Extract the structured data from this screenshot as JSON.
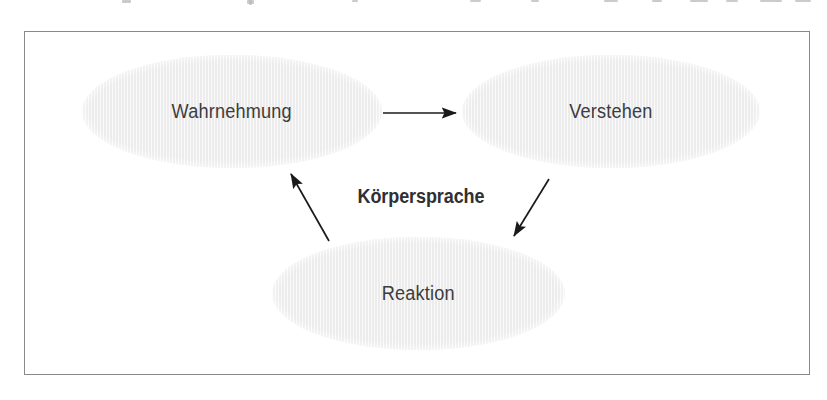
{
  "figure": {
    "kind": "cycle-diagram",
    "title_label": "Körpersprache",
    "frame": {
      "border_color": "#8a8a8e",
      "background_color": "#ffffff"
    },
    "page_background": "#ffffff",
    "node_fill_color": "#ececec",
    "node_text_color": "#3c3c3e",
    "arrow_color": "#1a1a1a",
    "nodes": [
      {
        "id": "wahrnehmung",
        "label": "Wahrnehmung"
      },
      {
        "id": "verstehen",
        "label": "Verstehen"
      },
      {
        "id": "reaktion",
        "label": "Reaktion"
      }
    ],
    "arrows": [
      {
        "id": "wahrnehmung-to-verstehen",
        "from": "wahrnehmung",
        "to": "verstehen",
        "direction": "right"
      },
      {
        "id": "verstehen-to-reaktion",
        "from": "verstehen",
        "to": "reaktion",
        "direction": "down-left"
      },
      {
        "id": "reaktion-to-wahrnehmung",
        "from": "reaktion",
        "to": "wahrnehmung",
        "direction": "up-left"
      }
    ]
  }
}
